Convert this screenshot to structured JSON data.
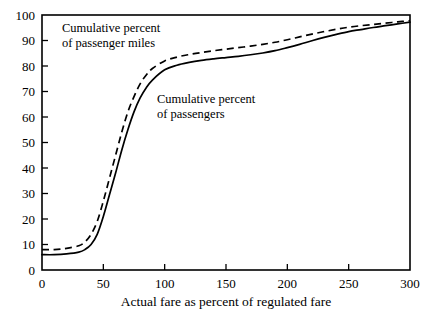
{
  "chart_data": {
    "type": "line",
    "title": "",
    "subtitle": "",
    "xlabel": "Actual fare as percent of regulated fare",
    "ylabel": "",
    "xlim": [
      0,
      300
    ],
    "ylim": [
      0,
      100
    ],
    "grid": false,
    "legend_position": "inline-annotations",
    "xticks": [
      0,
      50,
      100,
      150,
      200,
      250,
      300
    ],
    "yticks": [
      0,
      10,
      20,
      30,
      40,
      50,
      60,
      70,
      80,
      90,
      100
    ],
    "xtick_labels": [
      "0",
      "50",
      "100",
      "150",
      "200",
      "250",
      "300"
    ],
    "ytick_labels": [
      "0",
      "10",
      "20",
      "30",
      "40",
      "50",
      "60",
      "70",
      "80",
      "90",
      "100"
    ],
    "annotations": [
      {
        "name": "cumulative-percent-passenger-miles",
        "line1": "Cumulative percent",
        "line2": "of passenger miles",
        "x_px": 62,
        "y_px": 32
      },
      {
        "name": "cumulative-percent-passengers",
        "line1": "Cumulative percent",
        "line2": "of passengers",
        "x_px": 157,
        "y_px": 103
      }
    ],
    "x": [
      0,
      10,
      20,
      30,
      35,
      40,
      45,
      50,
      55,
      60,
      65,
      70,
      75,
      80,
      85,
      90,
      100,
      110,
      120,
      130,
      140,
      150,
      160,
      170,
      180,
      190,
      200,
      210,
      220,
      230,
      240,
      250,
      260,
      270,
      280,
      290,
      300
    ],
    "series": [
      {
        "name": "Cumulative percent of passenger miles",
        "style": "dashed",
        "color": "#000000",
        "values": [
          8,
          8,
          8.5,
          9.5,
          11,
          14,
          19,
          27,
          36,
          45,
          54,
          62,
          68,
          73,
          76.5,
          79,
          82,
          83.5,
          84.5,
          85.3,
          86,
          86.6,
          87.2,
          87.8,
          88.5,
          89.3,
          90.3,
          91.4,
          92.5,
          93.5,
          94.4,
          95.2,
          95.8,
          96.3,
          96.8,
          97.3,
          97.8
        ]
      },
      {
        "name": "Cumulative percent of passengers",
        "style": "solid",
        "color": "#000000",
        "values": [
          6,
          6,
          6.3,
          7,
          8,
          10,
          14,
          21,
          29.5,
          38,
          47,
          55,
          62,
          67.5,
          71.5,
          74.5,
          78.5,
          80.3,
          81.4,
          82.2,
          82.8,
          83.3,
          83.8,
          84.4,
          85.1,
          86,
          87.2,
          88.5,
          89.9,
          91.2,
          92.4,
          93.5,
          94.3,
          95.1,
          95.8,
          96.5,
          97.2
        ]
      }
    ]
  },
  "axes": {
    "x_axis_title": "Actual fare as percent of regulated fare"
  }
}
